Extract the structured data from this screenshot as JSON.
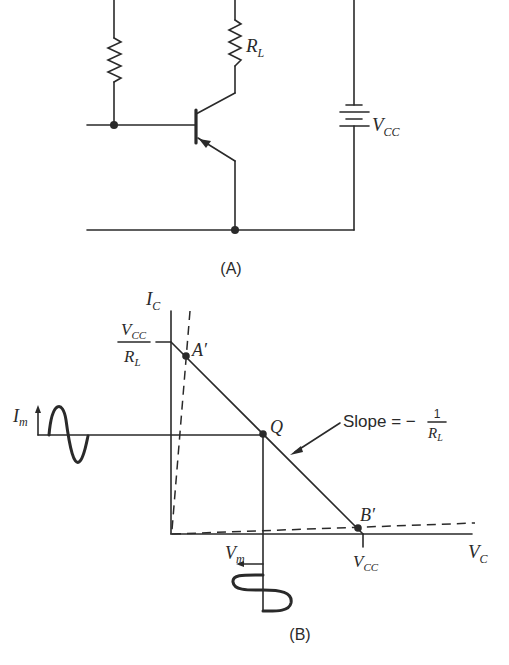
{
  "circuit": {
    "caption": "(A)",
    "load_resistor": {
      "main": "R",
      "sub": "L"
    },
    "supply": {
      "main": "V",
      "sub": "CC"
    }
  },
  "load_line": {
    "caption": "(B)",
    "y_axis": {
      "main": "I",
      "sub": "C"
    },
    "x_axis": {
      "main": "V",
      "sub": "C"
    },
    "y_intercept": {
      "num_main": "V",
      "num_sub": "CC",
      "den_main": "R",
      "den_sub": "L"
    },
    "x_intercept": {
      "main": "V",
      "sub": "CC"
    },
    "point_a": "A′",
    "point_q": "Q",
    "point_b": "B′",
    "current_swing": {
      "main": "I",
      "sub": "m"
    },
    "voltage_swing": {
      "main": "V",
      "sub": "m"
    },
    "slope_annotation": {
      "text": "Slope = −",
      "num": "1",
      "den_main": "R",
      "den_sub": "L"
    }
  }
}
